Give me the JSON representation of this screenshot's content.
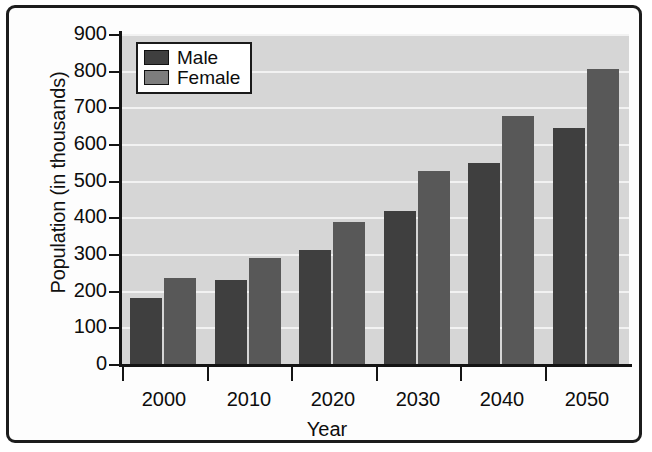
{
  "chart_data": {
    "type": "bar",
    "title": "",
    "xlabel": "Year",
    "ylabel": "Population (in thousands)",
    "categories": [
      "2000",
      "2010",
      "2020",
      "2030",
      "2040",
      "2050"
    ],
    "series": [
      {
        "name": "Male",
        "color": "#3f3f3f",
        "values": [
          180,
          230,
          312,
          418,
          547,
          645
        ]
      },
      {
        "name": "Female",
        "color": "#7d7d7d",
        "values": [
          235,
          288,
          388,
          527,
          677,
          805
        ]
      }
    ],
    "ylim": [
      0,
      900
    ],
    "ytick_values": [
      0,
      100,
      200,
      300,
      400,
      500,
      600,
      700,
      800,
      900
    ],
    "ytick_labels": [
      "0",
      "100",
      "200",
      "300",
      "400",
      "500",
      "600",
      "700",
      "800",
      "900"
    ],
    "grid": true,
    "grid_color": "#f2f2f2",
    "plot_background": "#d6d6d6",
    "legend_position": "top-left",
    "legend_entries": [
      "Male",
      "Female"
    ]
  }
}
